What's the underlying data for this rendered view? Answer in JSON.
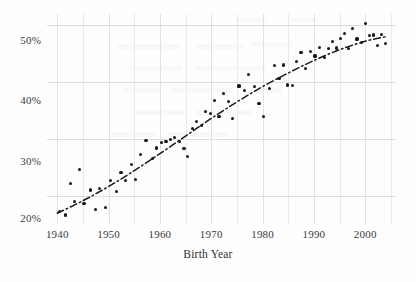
{
  "figure": {
    "background_color": "#fefefe",
    "ink_color": "#161616",
    "grid_color": "#e9e9ec"
  },
  "axes": {
    "x_title": "Birth Year",
    "y_title": "",
    "x_ticks": [
      "1940",
      "1950",
      "1960",
      "1970",
      "1980",
      "1990",
      "2000"
    ],
    "y_ticks": [
      "20%",
      "30%",
      "40%",
      "50%"
    ]
  },
  "chart_data": {
    "type": "scatter",
    "title": "",
    "xlabel": "Birth Year",
    "ylabel": "",
    "xlim": [
      1938,
      2006
    ],
    "ylim": [
      15,
      52
    ],
    "x_ticks": [
      1940,
      1950,
      1960,
      1970,
      1980,
      1990,
      2000
    ],
    "y_ticks": [
      20,
      30,
      40,
      50
    ],
    "y_tick_labels": [
      "20%",
      "30%",
      "40%",
      "50%"
    ],
    "grid": true,
    "legend": "none",
    "x_minor_tick_step": 5,
    "points": [
      {
        "x": 1940.4,
        "y": 17.2
      },
      {
        "x": 1941.6,
        "y": 16.6
      },
      {
        "x": 1942.5,
        "y": 22.2
      },
      {
        "x": 1943.4,
        "y": 19.0
      },
      {
        "x": 1944.3,
        "y": 24.6
      },
      {
        "x": 1945.2,
        "y": 18.6
      },
      {
        "x": 1946.5,
        "y": 21.0
      },
      {
        "x": 1947.4,
        "y": 17.6
      },
      {
        "x": 1948.3,
        "y": 21.3
      },
      {
        "x": 1949.4,
        "y": 17.9
      },
      {
        "x": 1950.4,
        "y": 22.7
      },
      {
        "x": 1951.6,
        "y": 20.7
      },
      {
        "x": 1952.4,
        "y": 24.1
      },
      {
        "x": 1953.3,
        "y": 22.6
      },
      {
        "x": 1954.5,
        "y": 25.5
      },
      {
        "x": 1955.3,
        "y": 22.9
      },
      {
        "x": 1956.2,
        "y": 27.3
      },
      {
        "x": 1957.3,
        "y": 29.7
      },
      {
        "x": 1958.5,
        "y": 26.6
      },
      {
        "x": 1959.4,
        "y": 28.4
      },
      {
        "x": 1960.3,
        "y": 29.3
      },
      {
        "x": 1961.2,
        "y": 29.6
      },
      {
        "x": 1962.1,
        "y": 29.9
      },
      {
        "x": 1962.9,
        "y": 30.2
      },
      {
        "x": 1963.8,
        "y": 29.6
      },
      {
        "x": 1964.7,
        "y": 28.3
      },
      {
        "x": 1965.4,
        "y": 26.9
      },
      {
        "x": 1966.3,
        "y": 31.8
      },
      {
        "x": 1967.2,
        "y": 33.1
      },
      {
        "x": 1968.1,
        "y": 32.4
      },
      {
        "x": 1968.9,
        "y": 34.8
      },
      {
        "x": 1969.8,
        "y": 34.4
      },
      {
        "x": 1970.6,
        "y": 36.8
      },
      {
        "x": 1971.5,
        "y": 33.9
      },
      {
        "x": 1972.4,
        "y": 38.0
      },
      {
        "x": 1973.3,
        "y": 36.6
      },
      {
        "x": 1974.2,
        "y": 33.6
      },
      {
        "x": 1975.4,
        "y": 39.3
      },
      {
        "x": 1976.5,
        "y": 38.5
      },
      {
        "x": 1977.3,
        "y": 41.4
      },
      {
        "x": 1978.4,
        "y": 39.2
      },
      {
        "x": 1979.3,
        "y": 36.3
      },
      {
        "x": 1980.2,
        "y": 34.0
      },
      {
        "x": 1981.3,
        "y": 38.9
      },
      {
        "x": 1982.4,
        "y": 42.9
      },
      {
        "x": 1983.2,
        "y": 40.6
      },
      {
        "x": 1984.1,
        "y": 43.0
      },
      {
        "x": 1984.9,
        "y": 39.5
      },
      {
        "x": 1985.8,
        "y": 39.4
      },
      {
        "x": 1986.6,
        "y": 43.7
      },
      {
        "x": 1987.5,
        "y": 45.2
      },
      {
        "x": 1988.4,
        "y": 42.4
      },
      {
        "x": 1989.3,
        "y": 45.4
      },
      {
        "x": 1990.2,
        "y": 44.6
      },
      {
        "x": 1991.1,
        "y": 46.1
      },
      {
        "x": 1992.0,
        "y": 44.4
      },
      {
        "x": 1992.8,
        "y": 45.9
      },
      {
        "x": 1993.6,
        "y": 47.2
      },
      {
        "x": 1994.4,
        "y": 46.0
      },
      {
        "x": 1995.2,
        "y": 47.7
      },
      {
        "x": 1996.0,
        "y": 48.6
      },
      {
        "x": 1996.8,
        "y": 45.9
      },
      {
        "x": 1997.6,
        "y": 49.5
      },
      {
        "x": 1998.4,
        "y": 47.6
      },
      {
        "x": 1999.2,
        "y": 47.0
      },
      {
        "x": 2000.0,
        "y": 50.3
      },
      {
        "x": 2000.8,
        "y": 48.2
      },
      {
        "x": 2001.6,
        "y": 48.3
      },
      {
        "x": 2002.4,
        "y": 46.5
      },
      {
        "x": 2003.2,
        "y": 48.4
      },
      {
        "x": 2004.0,
        "y": 46.8
      }
    ],
    "trend_line": {
      "style": "dash-dot",
      "color": "#1a1a1a",
      "x": [
        1940,
        1945,
        1950,
        1955,
        1960,
        1965,
        1970,
        1975,
        1980,
        1985,
        1990,
        1995,
        2000,
        2004
      ],
      "y": [
        16.9,
        19.1,
        21.6,
        24.4,
        27.4,
        30.5,
        33.6,
        36.5,
        39.2,
        41.6,
        43.8,
        45.7,
        47.2,
        48.0
      ]
    }
  }
}
